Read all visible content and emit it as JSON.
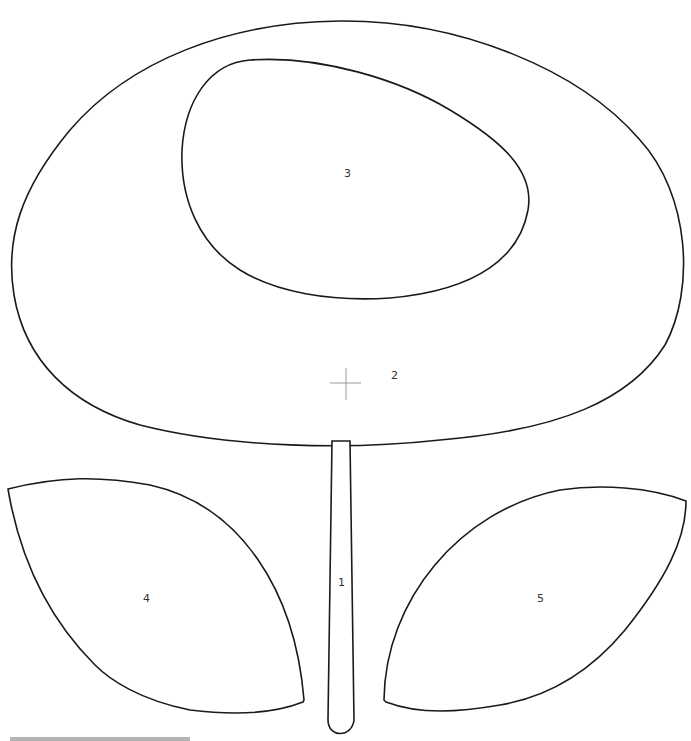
{
  "template": {
    "title": "",
    "pieces": [
      {
        "id": "1",
        "name": "stem",
        "label": "1"
      },
      {
        "id": "2",
        "name": "flower-head",
        "label": "2"
      },
      {
        "id": "3",
        "name": "flower-center",
        "label": "3"
      },
      {
        "id": "4",
        "name": "left-leaf",
        "label": "4"
      },
      {
        "id": "5",
        "name": "right-leaf",
        "label": "5"
      }
    ],
    "center_mark": "crosshair",
    "colors": {
      "outline": "#1a1a1a",
      "background": "#ffffff",
      "crosshair": "#999999",
      "bar": "#b3b3b3"
    }
  }
}
